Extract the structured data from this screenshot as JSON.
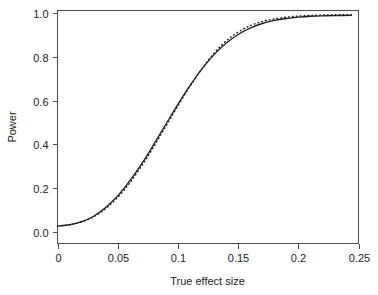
{
  "chart_data": {
    "type": "line",
    "title": "",
    "xlabel": "True effect size",
    "ylabel": "Power",
    "xlim": [
      0,
      0.25
    ],
    "ylim": [
      0,
      1.0
    ],
    "xticks": [
      0,
      0.05,
      0.1,
      0.15,
      0.2,
      0.25
    ],
    "xtick_labels": [
      "0",
      "0.05",
      "0.1",
      "0.15",
      "0.2",
      "0.25"
    ],
    "yticks": [
      0.0,
      0.2,
      0.4,
      0.6,
      0.8,
      1.0
    ],
    "ytick_labels": [
      "0.0",
      "0.2",
      "0.4",
      "0.6",
      "0.8",
      "1.0"
    ],
    "grid": false,
    "legend": "none",
    "x": [
      0.0,
      0.01,
      0.02,
      0.03,
      0.04,
      0.05,
      0.06,
      0.07,
      0.08,
      0.09,
      0.1,
      0.11,
      0.12,
      0.13,
      0.14,
      0.15,
      0.16,
      0.17,
      0.18,
      0.19,
      0.2,
      0.21,
      0.22,
      0.23,
      0.244
    ],
    "series": [
      {
        "name": "solid-curve",
        "style": "solid",
        "color": "#1f1f1f",
        "values": [
          0.027,
          0.033,
          0.047,
          0.072,
          0.112,
          0.165,
          0.233,
          0.312,
          0.4,
          0.492,
          0.583,
          0.668,
          0.745,
          0.81,
          0.862,
          0.902,
          0.931,
          0.952,
          0.966,
          0.975,
          0.981,
          0.985,
          0.987,
          0.988,
          0.989
        ]
      },
      {
        "name": "dotted-curve",
        "style": "dotted",
        "color": "#1f1f1f",
        "values": [
          0.027,
          0.033,
          0.046,
          0.069,
          0.107,
          0.158,
          0.224,
          0.302,
          0.39,
          0.483,
          0.576,
          0.665,
          0.746,
          0.816,
          0.872,
          0.913,
          0.942,
          0.961,
          0.973,
          0.981,
          0.986,
          0.989,
          0.991,
          0.992,
          0.993
        ]
      }
    ]
  }
}
